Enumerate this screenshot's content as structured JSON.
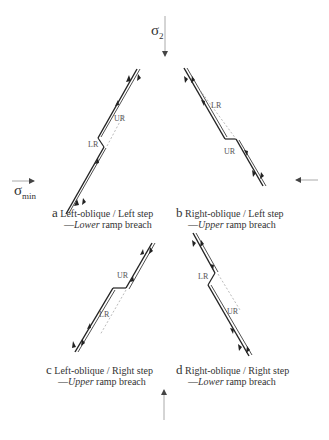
{
  "stress_labels": {
    "sigma2": {
      "symbol": "σ",
      "subscript": "2"
    },
    "sigma_min": {
      "symbol": "σ",
      "subscript": "min"
    }
  },
  "panels": [
    {
      "letter": "a",
      "title": "Left-oblique / Left step",
      "dash": "—",
      "emph": "Lower",
      "rest": " ramp breach",
      "ramp_labels": [
        "UR",
        "LR"
      ]
    },
    {
      "letter": "b",
      "title": "Right-oblique / Left step",
      "dash": "—",
      "emph": "Upper",
      "rest": " ramp breach",
      "ramp_labels": [
        "LR",
        "UR"
      ]
    },
    {
      "letter": "c",
      "title": "Left-oblique / Right step",
      "dash": "—",
      "emph": "Upper",
      "rest": " ramp breach",
      "ramp_labels": [
        "UR",
        "LR"
      ]
    },
    {
      "letter": "d",
      "title": "Right-oblique / Right step",
      "dash": "—",
      "emph": "Lower",
      "rest": " ramp breach",
      "ramp_labels": [
        "LR",
        "UR"
      ]
    }
  ],
  "colors": {
    "line": "#222222",
    "dashed": "#bbbbbb",
    "arrow": "#888888"
  }
}
